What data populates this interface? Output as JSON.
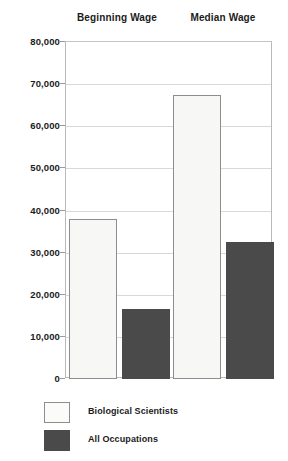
{
  "chart_data": {
    "type": "bar",
    "title": "",
    "subtitle": "",
    "xlabel": "",
    "ylabel": "",
    "categories": [
      "Beginning Wage",
      "Median Wage"
    ],
    "series": [
      {
        "name": "Biological Scientists",
        "color": "#f7f7f5",
        "values": [
          38000,
          67500
        ]
      },
      {
        "name": "All Occupations",
        "color": "#4a4a4a",
        "values": [
          16700,
          32500
        ]
      }
    ],
    "ylim": [
      0,
      80000
    ],
    "ytick_values": [
      0,
      10000,
      20000,
      30000,
      40000,
      50000,
      60000,
      70000,
      80000
    ],
    "ytick_labels": [
      "0",
      "10,000",
      "20,000",
      "30,000",
      "40,000",
      "50,000",
      "60,000",
      "70,000",
      "80,000"
    ],
    "grid": true,
    "legend_position": "bottom-left",
    "annotations": []
  },
  "headers": [
    {
      "label": "Beginning Wage"
    },
    {
      "label": "Median Wage"
    }
  ],
  "legend": {
    "items": [
      {
        "label": "Biological Scientists",
        "swatch": "light"
      },
      {
        "label": "All Occupations",
        "swatch": "dark"
      }
    ]
  }
}
